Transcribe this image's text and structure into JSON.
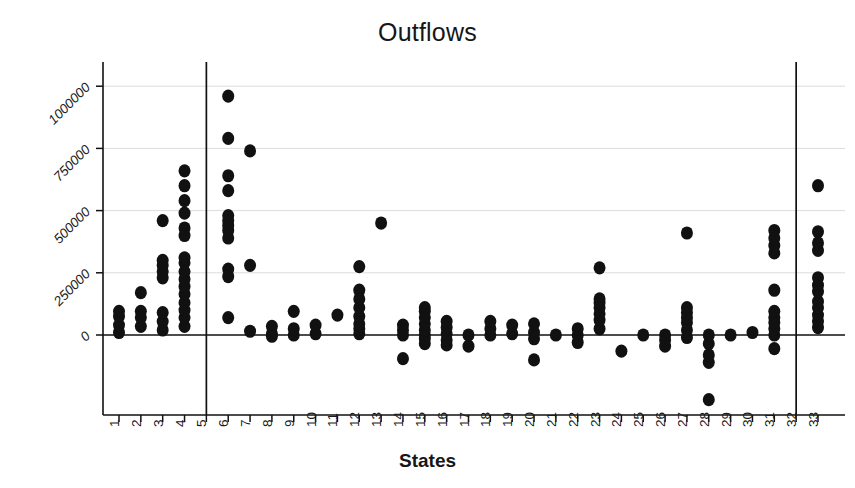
{
  "figure": {
    "title": "Outflows",
    "background": "#ffffff",
    "ink_color": "#111111"
  },
  "chart_data": {
    "type": "scatter",
    "title": "Outflows",
    "xlabel": "States",
    "ylabel": "",
    "grid": true,
    "legend": null,
    "xlim": [
      0.4,
      33.6
    ],
    "ylim": [
      -320000,
      1180000
    ],
    "yticks": [
      0,
      250000,
      500000,
      750000,
      1000000
    ],
    "ytick_labels": [
      "0",
      "250000",
      "500000",
      "750000",
      "1000000"
    ],
    "xticks": [
      1,
      2,
      3,
      4,
      5,
      6,
      7,
      8,
      9,
      10,
      11,
      12,
      13,
      14,
      15,
      16,
      17,
      18,
      19,
      20,
      21,
      22,
      23,
      24,
      25,
      26,
      27,
      28,
      29,
      30,
      31,
      32,
      33
    ],
    "xtick_labels": [
      "1",
      "2",
      "3",
      "4",
      "5",
      "6",
      "7",
      "8",
      "9",
      "10",
      "11",
      "12",
      "13",
      "14",
      "15",
      "16",
      "17",
      "18",
      "19",
      "20",
      "21",
      "22",
      "23",
      "24",
      "25",
      "26",
      "27",
      "28",
      "29",
      "30",
      "31",
      "32",
      "33"
    ],
    "reference_lines": {
      "horizontal": [
        0
      ],
      "vertical": [
        5,
        32
      ]
    },
    "marker": {
      "shape": "circle",
      "color": "#111111",
      "size": 9
    },
    "series": [
      {
        "name": "Outflows by state",
        "points": [
          [
            1,
            10000
          ],
          [
            1,
            40000
          ],
          [
            1,
            75000
          ],
          [
            1,
            95000
          ],
          [
            2,
            35000
          ],
          [
            2,
            70000
          ],
          [
            2,
            95000
          ],
          [
            2,
            170000
          ],
          [
            3,
            20000
          ],
          [
            3,
            55000
          ],
          [
            3,
            90000
          ],
          [
            3,
            230000
          ],
          [
            3,
            255000
          ],
          [
            3,
            280000
          ],
          [
            3,
            300000
          ],
          [
            3,
            460000
          ],
          [
            4,
            35000
          ],
          [
            4,
            70000
          ],
          [
            4,
            100000
          ],
          [
            4,
            130000
          ],
          [
            4,
            165000
          ],
          [
            4,
            195000
          ],
          [
            4,
            225000
          ],
          [
            4,
            255000
          ],
          [
            4,
            290000
          ],
          [
            4,
            310000
          ],
          [
            4,
            400000
          ],
          [
            4,
            430000
          ],
          [
            4,
            490000
          ],
          [
            4,
            540000
          ],
          [
            4,
            600000
          ],
          [
            4,
            660000
          ],
          [
            6,
            70000
          ],
          [
            6,
            235000
          ],
          [
            6,
            265000
          ],
          [
            6,
            390000
          ],
          [
            6,
            420000
          ],
          [
            6,
            440000
          ],
          [
            6,
            460000
          ],
          [
            6,
            480000
          ],
          [
            6,
            580000
          ],
          [
            6,
            640000
          ],
          [
            6,
            790000
          ],
          [
            6,
            960000
          ],
          [
            7,
            15000
          ],
          [
            7,
            280000
          ],
          [
            7,
            740000
          ],
          [
            8,
            5000
          ],
          [
            8,
            35000
          ],
          [
            8,
            -5000
          ],
          [
            9,
            0
          ],
          [
            9,
            25000
          ],
          [
            9,
            95000
          ],
          [
            10,
            5000
          ],
          [
            10,
            40000
          ],
          [
            11,
            80000
          ],
          [
            12,
            5000
          ],
          [
            12,
            25000
          ],
          [
            12,
            45000
          ],
          [
            12,
            75000
          ],
          [
            12,
            110000
          ],
          [
            12,
            145000
          ],
          [
            12,
            180000
          ],
          [
            12,
            275000
          ],
          [
            13,
            450000
          ],
          [
            14,
            -95000
          ],
          [
            14,
            0
          ],
          [
            14,
            20000
          ],
          [
            14,
            40000
          ],
          [
            15,
            -35000
          ],
          [
            15,
            -15000
          ],
          [
            15,
            0
          ],
          [
            15,
            20000
          ],
          [
            15,
            45000
          ],
          [
            15,
            70000
          ],
          [
            15,
            95000
          ],
          [
            15,
            110000
          ],
          [
            16,
            -40000
          ],
          [
            16,
            -20000
          ],
          [
            16,
            5000
          ],
          [
            16,
            30000
          ],
          [
            16,
            55000
          ],
          [
            17,
            -45000
          ],
          [
            17,
            0
          ],
          [
            18,
            0
          ],
          [
            18,
            25000
          ],
          [
            18,
            55000
          ],
          [
            19,
            5000
          ],
          [
            19,
            40000
          ],
          [
            20,
            -100000
          ],
          [
            20,
            -15000
          ],
          [
            20,
            10000
          ],
          [
            20,
            45000
          ],
          [
            21,
            0
          ],
          [
            22,
            -30000
          ],
          [
            22,
            0
          ],
          [
            22,
            25000
          ],
          [
            23,
            25000
          ],
          [
            23,
            60000
          ],
          [
            23,
            85000
          ],
          [
            23,
            110000
          ],
          [
            23,
            130000
          ],
          [
            23,
            145000
          ],
          [
            23,
            270000
          ],
          [
            24,
            -65000
          ],
          [
            25,
            0
          ],
          [
            26,
            -45000
          ],
          [
            26,
            -20000
          ],
          [
            26,
            0
          ],
          [
            27,
            -10000
          ],
          [
            27,
            20000
          ],
          [
            27,
            50000
          ],
          [
            27,
            70000
          ],
          [
            27,
            90000
          ],
          [
            27,
            110000
          ],
          [
            27,
            410000
          ],
          [
            28,
            -260000
          ],
          [
            28,
            -110000
          ],
          [
            28,
            -80000
          ],
          [
            28,
            -35000
          ],
          [
            28,
            0
          ],
          [
            29,
            0
          ],
          [
            30,
            10000
          ],
          [
            31,
            -55000
          ],
          [
            31,
            0
          ],
          [
            31,
            25000
          ],
          [
            31,
            50000
          ],
          [
            31,
            70000
          ],
          [
            31,
            95000
          ],
          [
            31,
            180000
          ],
          [
            31,
            330000
          ],
          [
            31,
            360000
          ],
          [
            31,
            390000
          ],
          [
            31,
            420000
          ],
          [
            33,
            30000
          ],
          [
            33,
            55000
          ],
          [
            33,
            80000
          ],
          [
            33,
            110000
          ],
          [
            33,
            135000
          ],
          [
            33,
            175000
          ],
          [
            33,
            200000
          ],
          [
            33,
            230000
          ],
          [
            33,
            340000
          ],
          [
            33,
            370000
          ],
          [
            33,
            415000
          ],
          [
            33,
            600000
          ]
        ]
      }
    ]
  }
}
